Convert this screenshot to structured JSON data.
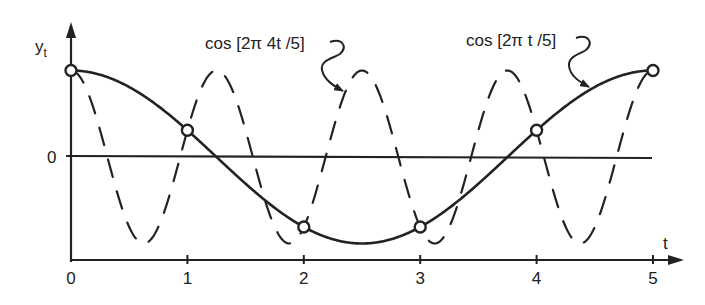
{
  "chart_data": {
    "type": "line",
    "title": "",
    "xlabel": "t",
    "ylabel": "y_t",
    "ylabel_main": "y",
    "ylabel_sub": "t",
    "xlim": [
      0,
      5
    ],
    "ylim": [
      -1,
      1
    ],
    "x_ticks": [
      0,
      1,
      2,
      3,
      4,
      5
    ],
    "x_tick_labels": [
      "0",
      "1",
      "2",
      "3",
      "4",
      "5"
    ],
    "y_tick_labels": [
      "0"
    ],
    "grid": false,
    "legend": "none",
    "series": [
      {
        "name": "cos [2π t /5]",
        "style": "solid",
        "frequency": 0.2,
        "formula": "cos(2*pi*t/5)",
        "sample_points": {
          "t": [
            0,
            1,
            2,
            3,
            4,
            5
          ],
          "y": [
            1.0,
            0.309,
            -0.809,
            -0.809,
            0.309,
            1.0
          ]
        }
      },
      {
        "name": "cos [2π 4t /5]",
        "style": "dashed",
        "frequency": 0.8,
        "formula": "cos(2*pi*4*t/5)",
        "sample_points": {
          "t": [
            0,
            1,
            2,
            3,
            4,
            5
          ],
          "y": [
            1.0,
            0.309,
            -0.809,
            -0.809,
            0.309,
            1.0
          ]
        }
      }
    ],
    "annotations": [
      {
        "text": "cos [2π 4t /5]",
        "points_to": "dashed curve near t=2.35"
      },
      {
        "text": "cos [2π t /5]",
        "points_to": "solid curve near t=4.5"
      }
    ],
    "marked_points": "open circles at integer t = 0..5 where both curves coincide"
  },
  "labels": {
    "x_axis": "t",
    "y_axis_main": "y",
    "y_axis_sub": "t",
    "zero": "0",
    "ticks": [
      "0",
      "1",
      "2",
      "3",
      "4",
      "5"
    ],
    "curve_slow": "cos [2π t /5]",
    "curve_fast": "cos [2π 4t /5]"
  },
  "colors": {
    "ink": "#222222",
    "background": "#ffffff"
  }
}
